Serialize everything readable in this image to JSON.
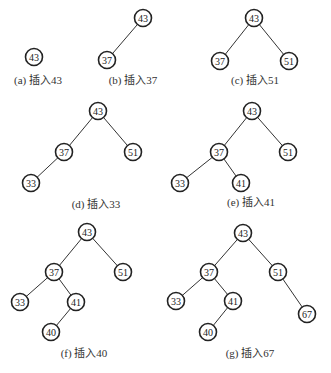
{
  "node_radius": 8.5,
  "panels": [
    {
      "id": "a",
      "caption": "(a) 插入43",
      "caption_pos": [
        38,
        84
      ],
      "nodes": [
        {
          "key": "43",
          "x": 34,
          "y": 57
        }
      ],
      "edges": []
    },
    {
      "id": "b",
      "caption": "(b) 插入37",
      "caption_pos": [
        133,
        84
      ],
      "nodes": [
        {
          "key": "43",
          "x": 143,
          "y": 18
        },
        {
          "key": "37",
          "x": 107,
          "y": 60
        }
      ],
      "edges": [
        [
          "43",
          "37"
        ]
      ]
    },
    {
      "id": "c",
      "caption": "(c) 插入51",
      "caption_pos": [
        255,
        84
      ],
      "nodes": [
        {
          "key": "43",
          "x": 254,
          "y": 18
        },
        {
          "key": "37",
          "x": 220,
          "y": 61
        },
        {
          "key": "51",
          "x": 289,
          "y": 61
        }
      ],
      "edges": [
        [
          "43",
          "37"
        ],
        [
          "43",
          "51"
        ]
      ]
    },
    {
      "id": "d",
      "caption": "(d) 插入33",
      "caption_pos": [
        96,
        208
      ],
      "nodes": [
        {
          "key": "43",
          "x": 98,
          "y": 111
        },
        {
          "key": "37",
          "x": 64,
          "y": 152
        },
        {
          "key": "51",
          "x": 133,
          "y": 152
        },
        {
          "key": "33",
          "x": 31,
          "y": 183
        }
      ],
      "edges": [
        [
          "43",
          "37"
        ],
        [
          "43",
          "51"
        ],
        [
          "37",
          "33"
        ]
      ]
    },
    {
      "id": "e",
      "caption": "(e) 插入41",
      "caption_pos": [
        251,
        206
      ],
      "nodes": [
        {
          "key": "43",
          "x": 252,
          "y": 111
        },
        {
          "key": "37",
          "x": 219,
          "y": 152
        },
        {
          "key": "51",
          "x": 288,
          "y": 152
        },
        {
          "key": "33",
          "x": 180,
          "y": 183
        },
        {
          "key": "41",
          "x": 241,
          "y": 183
        }
      ],
      "edges": [
        [
          "43",
          "37"
        ],
        [
          "43",
          "51"
        ],
        [
          "37",
          "33"
        ],
        [
          "37",
          "41"
        ]
      ]
    },
    {
      "id": "f",
      "caption": "(f) 插入40",
      "caption_pos": [
        84,
        357
      ],
      "nodes": [
        {
          "key": "43",
          "x": 87,
          "y": 232
        },
        {
          "key": "37",
          "x": 54,
          "y": 272
        },
        {
          "key": "51",
          "x": 123,
          "y": 272
        },
        {
          "key": "33",
          "x": 20,
          "y": 302
        },
        {
          "key": "41",
          "x": 76,
          "y": 302
        },
        {
          "key": "40",
          "x": 51,
          "y": 332
        }
      ],
      "edges": [
        [
          "43",
          "37"
        ],
        [
          "43",
          "51"
        ],
        [
          "37",
          "33"
        ],
        [
          "37",
          "41"
        ],
        [
          "41",
          "40"
        ]
      ]
    },
    {
      "id": "g",
      "caption": "(g) 插入67",
      "caption_pos": [
        250,
        357
      ],
      "nodes": [
        {
          "key": "43",
          "x": 243,
          "y": 233
        },
        {
          "key": "37",
          "x": 209,
          "y": 272
        },
        {
          "key": "51",
          "x": 278,
          "y": 272
        },
        {
          "key": "33",
          "x": 176,
          "y": 301
        },
        {
          "key": "41",
          "x": 233,
          "y": 301
        },
        {
          "key": "40",
          "x": 208,
          "y": 332
        },
        {
          "key": "67",
          "x": 307,
          "y": 314
        }
      ],
      "edges": [
        [
          "43",
          "37"
        ],
        [
          "43",
          "51"
        ],
        [
          "37",
          "33"
        ],
        [
          "37",
          "41"
        ],
        [
          "41",
          "40"
        ],
        [
          "51",
          "67"
        ]
      ]
    }
  ]
}
